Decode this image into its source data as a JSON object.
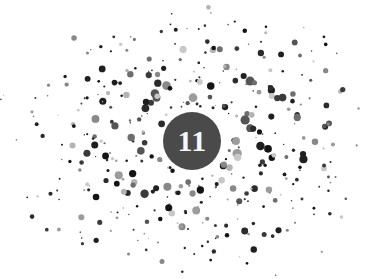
{
  "figure": {
    "kind": "decorative-chapter-opener",
    "width": 385,
    "height": 279,
    "background_color": "#ffffff",
    "description_label": "Spiral galaxy of dots surrounding a chapter number badge"
  },
  "badge": {
    "number_label": "11",
    "fill_color": "#4a4a4a",
    "text_color": "#f7f7f5",
    "center_x": 192,
    "center_y": 141,
    "radius": 29,
    "font_size_px": 30
  },
  "spiral": {
    "center_x": 192,
    "center_y": 141,
    "arm_count": 3,
    "turns": 1.62,
    "start_radius": 36,
    "end_radius": 178,
    "x_scale": 1.0,
    "y_scale": 0.78,
    "rotation_deg": -18,
    "dots_per_arm": 150,
    "jitter_radial": 17,
    "jitter_angular": 0.1,
    "dot_min_radius": 0.7,
    "dot_max_radius": 4.2,
    "palette": [
      "#141414",
      "#1f1f1f",
      "#2b2b2b",
      "#3a3a3a",
      "#555555",
      "#6e6e6e",
      "#888888",
      "#9c9c9c",
      "#b4b4b4",
      "#c8c8c8"
    ],
    "palette_weights": [
      14,
      13,
      12,
      11,
      10,
      10,
      9,
      8,
      7,
      6
    ],
    "seed": 20110711
  }
}
